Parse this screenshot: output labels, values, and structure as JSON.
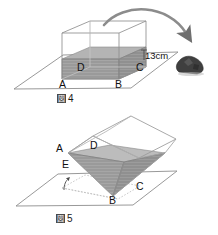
{
  "figure_top": {
    "caption": "図 4",
    "caption_kanji": "図",
    "caption_number": "4",
    "vertex_labels": [
      "A",
      "B",
      "C",
      "D"
    ],
    "dimension_label": "13cm",
    "objects": {
      "container": "rectangular-container",
      "water": "water-fill",
      "rock": "rock",
      "arrow": "curved-arrow"
    }
  },
  "figure_bottom": {
    "caption": "図 5",
    "caption_kanji": "図",
    "caption_number": "5",
    "vertex_labels": [
      "A",
      "B",
      "C",
      "D",
      "E"
    ],
    "objects": {
      "container": "tilted-container",
      "water": "water-fill",
      "projection": "dotted-projection",
      "tilt_marker": "tilt-arrow"
    }
  },
  "colors": {
    "water": "#9a9a9a",
    "water_dark": "#8a8a8a",
    "outline": "#6e6e6e",
    "outline_light": "#a8a8a8",
    "rock": "#3c3c3c",
    "arrow": "#8c8c8c",
    "text": "#111111",
    "background": "#ffffff"
  }
}
